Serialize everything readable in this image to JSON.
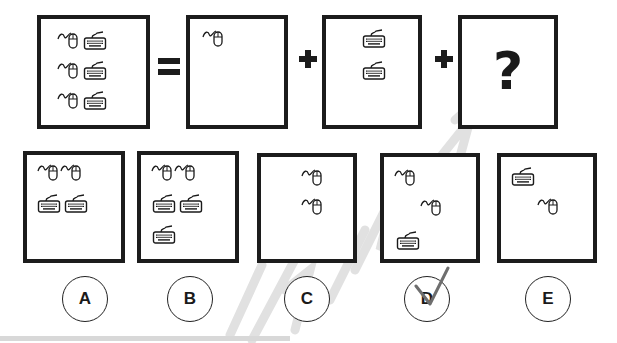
{
  "puzzle": {
    "equation": {
      "whole": {
        "label": "Whole set",
        "items": [
          "mouse",
          "keyboard",
          "mouse",
          "keyboard",
          "mouse",
          "keyboard"
        ],
        "count": {
          "mouse": 3,
          "keyboard": 3
        }
      },
      "equals_symbol": "=",
      "part1": {
        "items": [
          "mouse"
        ],
        "count": {
          "mouse": 1,
          "keyboard": 0
        }
      },
      "plus_symbol_1": "+",
      "part2": {
        "items": [
          "keyboard",
          "keyboard"
        ],
        "count": {
          "mouse": 0,
          "keyboard": 2
        }
      },
      "plus_symbol_2": "+",
      "unknown": {
        "text": "?"
      }
    },
    "options": [
      {
        "letter": "A",
        "items": [
          "mouse",
          "mouse",
          "keyboard",
          "keyboard"
        ],
        "count": {
          "mouse": 2,
          "keyboard": 2
        }
      },
      {
        "letter": "B",
        "items": [
          "mouse",
          "mouse",
          "keyboard",
          "keyboard",
          "keyboard"
        ],
        "count": {
          "mouse": 2,
          "keyboard": 3
        }
      },
      {
        "letter": "C",
        "items": [
          "mouse",
          "mouse"
        ],
        "count": {
          "mouse": 2,
          "keyboard": 0
        }
      },
      {
        "letter": "D",
        "items": [
          "mouse",
          "mouse",
          "keyboard"
        ],
        "count": {
          "mouse": 2,
          "keyboard": 1
        },
        "marked": "checkmark"
      },
      {
        "letter": "E",
        "items": [
          "keyboard",
          "mouse"
        ],
        "count": {
          "mouse": 1,
          "keyboard": 1
        }
      }
    ],
    "selected_answer": "D"
  },
  "icons": {
    "mouse": "computer-mouse-icon",
    "keyboard": "keyboard-icon"
  },
  "colors": {
    "border": "#1c1c1c",
    "background": "#ffffff",
    "watermark": "#d9d9d9",
    "checkmark": "#6e6e6e"
  }
}
